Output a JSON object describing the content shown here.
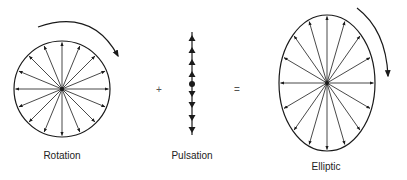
{
  "diagram": {
    "labels": {
      "rotation": "Rotation",
      "pulsation": "Pulsation",
      "elliptic": "Elliptic"
    },
    "operators": {
      "plus": "+",
      "equals": "="
    },
    "panels": [
      {
        "name": "rotation",
        "shape": "circle",
        "spokes": 16,
        "arrow_direction": "clockwise"
      },
      {
        "name": "pulsation",
        "shape": "line",
        "arrowheads_up": 4,
        "arrowheads_down": 4
      },
      {
        "name": "elliptic",
        "shape": "ellipse",
        "spokes": 16,
        "arrow_direction": "clockwise"
      }
    ],
    "stroke_color": "#1a1a1a"
  }
}
